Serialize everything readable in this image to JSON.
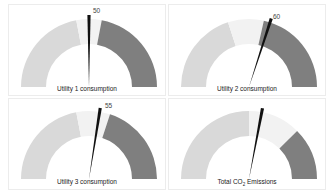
{
  "chart_data": [
    {
      "type": "gauge",
      "title": "Utility 1 consumption",
      "value": 50,
      "value_label": "50",
      "range": [
        0,
        100
      ],
      "bands": [
        {
          "from": 0,
          "to": 44,
          "color": "#d9d9d9"
        },
        {
          "from": 44,
          "to": 56,
          "color": "#f2f2f2"
        },
        {
          "from": 56,
          "to": 100,
          "color": "#7f7f7f"
        }
      ]
    },
    {
      "type": "gauge",
      "title": "Utility 2 consumption",
      "value": 60,
      "value_label": "60",
      "range": [
        0,
        100
      ],
      "bands": [
        {
          "from": 0,
          "to": 40,
          "color": "#d9d9d9"
        },
        {
          "from": 40,
          "to": 57,
          "color": "#f2f2f2"
        },
        {
          "from": 57,
          "to": 100,
          "color": "#7f7f7f"
        }
      ]
    },
    {
      "type": "gauge",
      "title": "Utility 3 consumption",
      "value": 55,
      "value_label": "55",
      "range": [
        0,
        100
      ],
      "bands": [
        {
          "from": 0,
          "to": 44,
          "color": "#d9d9d9"
        },
        {
          "from": 44,
          "to": 60,
          "color": "#f2f2f2"
        },
        {
          "from": 60,
          "to": 100,
          "color": "#7f7f7f"
        }
      ]
    },
    {
      "type": "gauge",
      "title": "Total CO2 Emissions",
      "title_parts": {
        "pre": "Total CO",
        "sub": "2",
        "post": " Emissions"
      },
      "value": 56,
      "value_label": "",
      "range": [
        0,
        100
      ],
      "bands": [
        {
          "from": 0,
          "to": 50,
          "color": "#d9d9d9"
        },
        {
          "from": 50,
          "to": 75,
          "color": "#f2f2f2"
        },
        {
          "from": 75,
          "to": 100,
          "color": "#7f7f7f"
        }
      ]
    }
  ],
  "layout": {
    "grid": "2x2",
    "needle_color": "#111111"
  }
}
